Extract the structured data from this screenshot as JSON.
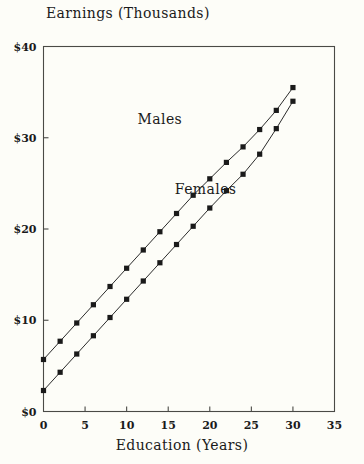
{
  "chart_data": {
    "type": "line",
    "title": "Earnings (Thousands)",
    "xlabel": "Education (Years)",
    "ylabel": "",
    "xlim": [
      0,
      35
    ],
    "ylim": [
      0,
      40
    ],
    "grid": false,
    "legend_position": "inline-annotation",
    "x": [
      0,
      2,
      4,
      6,
      8,
      10,
      12,
      14,
      16,
      18,
      20,
      22,
      24,
      26,
      28,
      30
    ],
    "xticks": [
      0,
      5,
      10,
      15,
      20,
      25,
      30,
      35
    ],
    "xtick_labels": [
      "0",
      "5",
      "10",
      "15",
      "20",
      "25",
      "30",
      "35"
    ],
    "yticks": [
      0,
      10,
      20,
      30,
      40
    ],
    "ytick_labels": [
      "$0",
      "$10",
      "$20",
      "$30",
      "$40"
    ],
    "marker": "square",
    "series": [
      {
        "name": "Males",
        "label_x": 14,
        "label_y": 31.5,
        "values": [
          5.7,
          7.7,
          9.7,
          11.7,
          13.7,
          15.7,
          17.7,
          19.7,
          21.7,
          23.7,
          25.5,
          27.3,
          29.0,
          30.9,
          33.0,
          35.5
        ]
      },
      {
        "name": "Females",
        "label_x": 19.5,
        "label_y": 23.8,
        "values": [
          2.3,
          4.3,
          6.3,
          8.3,
          10.3,
          12.3,
          14.3,
          16.3,
          18.3,
          20.3,
          22.3,
          24.2,
          26.0,
          28.2,
          31.0,
          34.0
        ]
      }
    ]
  },
  "axis": {
    "tick_length": 5,
    "frame_color": "#4a4a46"
  }
}
